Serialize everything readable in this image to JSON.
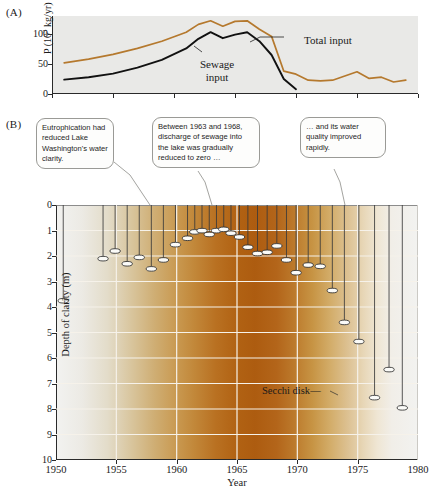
{
  "figure": {
    "panel_a_letter": "(A)",
    "panel_b_letter": "(B)"
  },
  "callouts": [
    {
      "id": "callout-1",
      "text": "Eutrophication had reduced Lake Washington's water clarity."
    },
    {
      "id": "callout-2",
      "text": "Between 1963 and 1968, discharge of sewage into the lake was gradually reduced to zero …"
    },
    {
      "id": "callout-3",
      "text": "… and its water quality improved rapidly."
    }
  ],
  "annotations": {
    "secchi_disk": "Secchi disk",
    "total_input": "Total input",
    "sewage_input_line1": "Sewage",
    "sewage_input_line2": "input"
  },
  "colors": {
    "total_input_line": "#b5792e",
    "sewage_input_line": "#111111",
    "panel_a_background": "#e9e9e7",
    "gradient_clear": "#f2f2f0",
    "gradient_turbid": "#ad5c10",
    "gridline": "#f6f2ea",
    "axis": "#2a2a2a"
  },
  "chart_data": [
    {
      "type": "line",
      "title": "(A) Phosphorus input to Lake Washington",
      "xlabel": "",
      "ylabel": "P (10³ kg/yr)",
      "ylim": [
        0,
        130
      ],
      "yticks": [
        0,
        50,
        100
      ],
      "ytick_labels": [
        "0",
        "50",
        "100"
      ],
      "xlim": [
        1950,
        1980
      ],
      "xticks": [
        1950,
        1955,
        1960,
        1965,
        1970,
        1975,
        1980
      ],
      "grid": false,
      "legend": "inline-annotations",
      "series": [
        {
          "name": "Total input",
          "color": "#b5792e",
          "x": [
            1951,
            1953,
            1955,
            1957,
            1959,
            1961,
            1962,
            1963,
            1964,
            1965,
            1966,
            1967,
            1968,
            1969,
            1970,
            1971,
            1972,
            1973,
            1974,
            1975,
            1976,
            1977,
            1978,
            1979
          ],
          "values": [
            52,
            58,
            66,
            76,
            88,
            103,
            116,
            122,
            113,
            121,
            122,
            108,
            96,
            38,
            33,
            23,
            22,
            23,
            30,
            37,
            26,
            28,
            20,
            23
          ]
        },
        {
          "name": "Sewage input",
          "color": "#111111",
          "x": [
            1951,
            1953,
            1955,
            1957,
            1959,
            1961,
            1962,
            1963,
            1964,
            1965,
            1966,
            1967,
            1968,
            1969,
            1970
          ],
          "values": [
            24,
            28,
            34,
            44,
            57,
            76,
            92,
            103,
            93,
            99,
            103,
            88,
            65,
            25,
            8
          ]
        }
      ]
    },
    {
      "type": "scatter",
      "title": "(B) Secchi disk depth of clarity in Lake Washington",
      "xlabel": "Year",
      "ylabel": "Depth of clarity (m)",
      "ylim": [
        0,
        10
      ],
      "y_inverted": true,
      "yticks": [
        0,
        1,
        2,
        3,
        4,
        5,
        6,
        7,
        8,
        9,
        10
      ],
      "ytick_labels": [
        "0",
        "1",
        "2",
        "3",
        "4",
        "5",
        "6",
        "7",
        "8",
        "9",
        "10"
      ],
      "xlim": [
        1950,
        1980
      ],
      "xticks": [
        1950,
        1955,
        1960,
        1965,
        1970,
        1975,
        1980
      ],
      "xtick_labels": [
        "1950",
        "1955",
        "1960",
        "1965",
        "1970",
        "1975",
        "1980"
      ],
      "grid": true,
      "marker": "secchi-disk-ellipse-on-line",
      "x": [
        1950.6,
        1953.9,
        1954.9,
        1955.9,
        1956.9,
        1957.9,
        1958.9,
        1959.9,
        1960.9,
        1961.5,
        1962.1,
        1962.7,
        1963.3,
        1963.9,
        1964.5,
        1965.2,
        1965.9,
        1966.7,
        1967.5,
        1968.3,
        1969.1,
        1969.9,
        1970.9,
        1971.9,
        1972.9,
        1973.9,
        1975.1,
        1976.4,
        1977.6,
        1978.7
      ],
      "values": [
        3.7,
        2.05,
        1.75,
        2.25,
        2.0,
        2.45,
        2.1,
        1.5,
        1.25,
        1.0,
        0.95,
        1.1,
        0.95,
        0.9,
        1.05,
        1.2,
        1.6,
        1.85,
        1.8,
        1.55,
        2.1,
        2.6,
        2.3,
        2.35,
        3.3,
        4.55,
        5.3,
        7.5,
        6.4,
        7.9
      ]
    }
  ]
}
